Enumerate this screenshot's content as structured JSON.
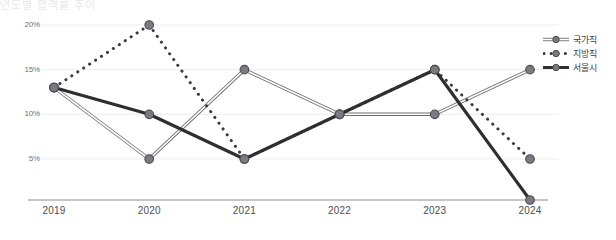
{
  "title_faint": "연도별 합격률 추이",
  "chart_data": {
    "type": "line",
    "title": "",
    "xlabel": "",
    "ylabel": "",
    "x": [
      "2019",
      "2020",
      "2021",
      "2022",
      "2023",
      "2024"
    ],
    "categories": [
      "2019",
      "2020",
      "2021",
      "2022",
      "2023",
      "2024"
    ],
    "ytick_labels": [
      "20%",
      "15%",
      "10%",
      "5%"
    ],
    "ytick_values": [
      20,
      15,
      10,
      5
    ],
    "ylim": [
      0,
      21.5
    ],
    "grid": true,
    "legend_position": "right",
    "series": [
      {
        "name": "국가직",
        "style": "double-line",
        "color": "#6f6f75",
        "values": [
          13,
          5,
          15,
          10,
          10,
          15
        ]
      },
      {
        "name": "지방직",
        "style": "dotted",
        "color": "#3a3a40",
        "values": [
          13,
          20,
          5,
          10,
          15,
          5
        ]
      },
      {
        "name": "서울시",
        "style": "bold-solid",
        "color": "#2e2e33",
        "values": [
          13,
          10,
          5,
          10,
          15,
          0
        ]
      }
    ]
  },
  "axis": {
    "axis_line_color": "#8d8d93",
    "grid_color": "#ededf0",
    "marker_fill": "#7a7a80",
    "marker_stroke": "#4a4a50"
  }
}
